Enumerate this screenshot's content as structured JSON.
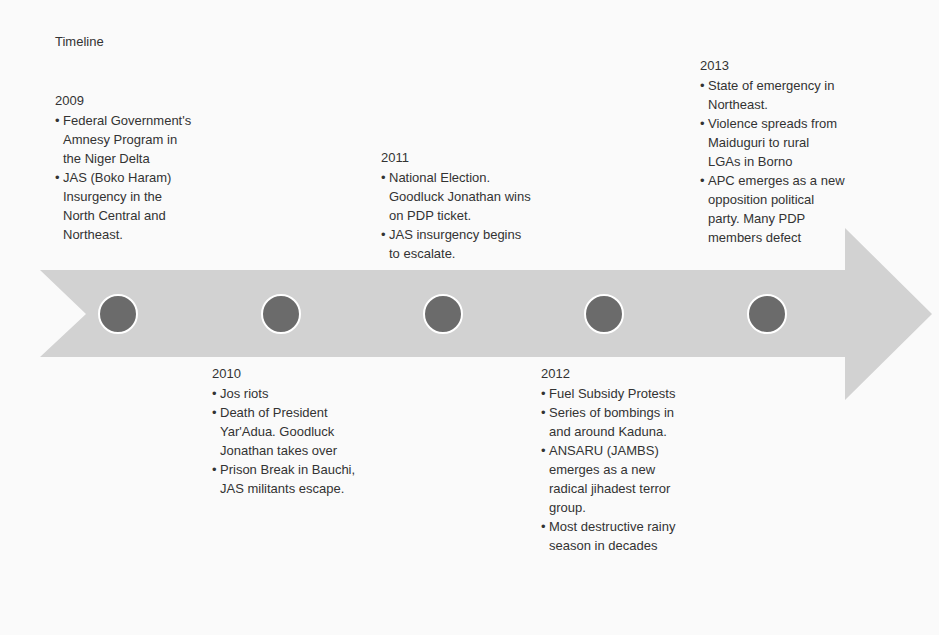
{
  "title": "Timeline",
  "colors": {
    "arrow": "#d2d2d2",
    "marker": "#6b6b6b",
    "marker_border": "#ffffff",
    "text": "#333333"
  },
  "events": [
    {
      "year": "2009",
      "position": "above",
      "bullets": [
        "Federal Government's Amnesy Program in the Niger Delta",
        "JAS (Boko Haram) Insurgency in the North Central and Northeast."
      ]
    },
    {
      "year": "2010",
      "position": "below",
      "bullets": [
        "Jos riots",
        "Death of President Yar'Adua.  Goodluck Jonathan takes over",
        "Prison Break in Bauchi, JAS militants escape."
      ]
    },
    {
      "year": "2011",
      "position": "above",
      "bullets": [
        "National Election. Goodluck Jonathan wins on PDP ticket.",
        "JAS insurgency begins to escalate."
      ]
    },
    {
      "year": "2012",
      "position": "below",
      "bullets": [
        "Fuel Subsidy Protests",
        "Series of bombings in and around Kaduna.",
        "ANSARU (JAMBS) emerges as a new radical jihadest terror group.",
        "Most destructive rainy season in decades"
      ]
    },
    {
      "year": "2013",
      "position": "above",
      "bullets": [
        "State of emergency in Northeast.",
        "Violence spreads from Maiduguri to rural LGAs in Borno",
        "APC emerges as a new opposition political party. Many PDP members defect"
      ]
    }
  ]
}
